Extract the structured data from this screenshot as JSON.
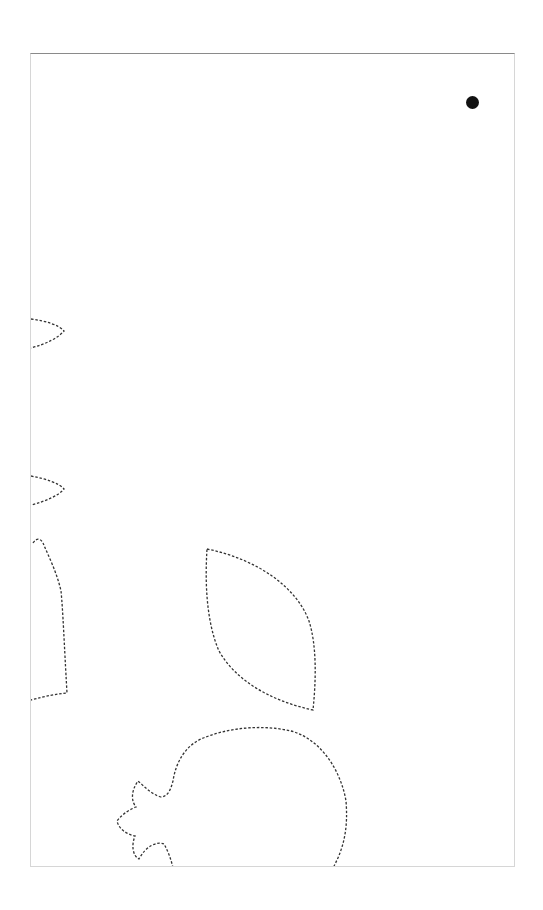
{
  "page": {
    "frame_color": "#d6d6d6",
    "frame_top_color": "#8a8a8a",
    "stroke_color": "#333333",
    "dot_color": "#111111"
  },
  "marker": {
    "label": "",
    "cx": 472,
    "cy": 102
  },
  "shapes": [
    {
      "name": "leaf-tip-upper",
      "description": "partial petal cutout at left edge"
    },
    {
      "name": "leaf-tip-lower",
      "description": "partial petal cutout at left edge"
    },
    {
      "name": "leaf-side-partial",
      "description": "partial leaf cutout at left edge"
    },
    {
      "name": "leaf-outline",
      "description": "dashed leaf cutout outline"
    },
    {
      "name": "pomegranate-outline",
      "description": "dashed pomegranate cutout outline with crown"
    }
  ]
}
